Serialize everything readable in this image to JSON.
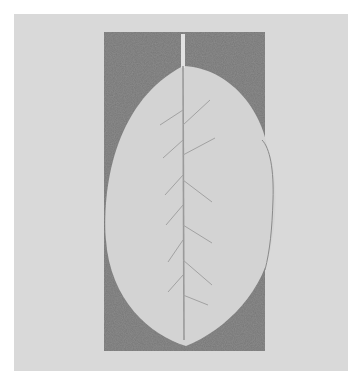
{
  "image": {
    "subject": "pencil rubbing of a leaf",
    "description": "Pale elliptical leaf with central midrib and pinnate side veins, set against a dark graphite-shaded rectangle on light gray paper",
    "colors": {
      "background": "#ffffff",
      "paper": "#d9d9d9",
      "graphite": "#6e6e6e",
      "leaf": "#d2d2d2",
      "vein": "#9a9a9a"
    }
  }
}
